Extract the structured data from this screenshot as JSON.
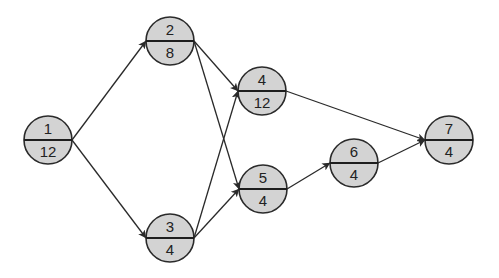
{
  "diagram": {
    "type": "activity-on-node network",
    "colors": {
      "node_fill": "#d3d3d3",
      "stroke": "#2a2a2a",
      "background": "#ffffff"
    },
    "nodes": [
      {
        "id": "1",
        "label": "1",
        "duration": "12"
      },
      {
        "id": "2",
        "label": "2",
        "duration": "8"
      },
      {
        "id": "3",
        "label": "3",
        "duration": "4"
      },
      {
        "id": "4",
        "label": "4",
        "duration": "12"
      },
      {
        "id": "5",
        "label": "5",
        "duration": "4"
      },
      {
        "id": "6",
        "label": "6",
        "duration": "4"
      },
      {
        "id": "7",
        "label": "7",
        "duration": "4"
      }
    ],
    "edges": [
      {
        "from": "1",
        "to": "2"
      },
      {
        "from": "1",
        "to": "3"
      },
      {
        "from": "2",
        "to": "4"
      },
      {
        "from": "2",
        "to": "5"
      },
      {
        "from": "3",
        "to": "4"
      },
      {
        "from": "3",
        "to": "5"
      },
      {
        "from": "4",
        "to": "7"
      },
      {
        "from": "5",
        "to": "6"
      },
      {
        "from": "6",
        "to": "7"
      }
    ]
  }
}
